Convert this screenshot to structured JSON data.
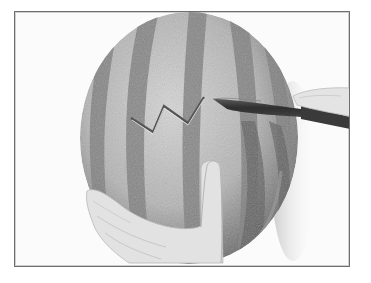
{
  "image": {
    "description": "Grayscale photo of a hand steadying a striped watermelon while a knife cuts a zigzag pattern into the rind",
    "subject": "watermelon",
    "action": "zigzag cut with knife",
    "palette": {
      "background": "#fbfbfb",
      "frame": "#6e6e6e",
      "rind_light": "#c9c9c9",
      "rind_dark": "#6a6a6a",
      "stripe": "#8a8a8a",
      "knife": "#3a3a3a",
      "skin": "#e2e2e2",
      "cut_line": "#555555"
    },
    "zigzag_points": [
      [
        130,
        117
      ],
      [
        152,
        131
      ],
      [
        163,
        105
      ],
      [
        187,
        122
      ],
      [
        203,
        96
      ]
    ]
  }
}
